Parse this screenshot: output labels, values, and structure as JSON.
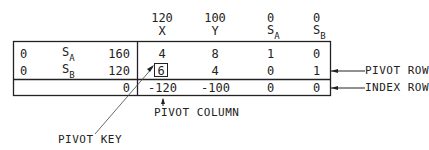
{
  "header": {
    "columns": [
      {
        "coef": "120",
        "var": "X",
        "sub": ""
      },
      {
        "coef": "100",
        "var": "Y",
        "sub": ""
      },
      {
        "coef": "0",
        "var": "S",
        "sub": "A"
      },
      {
        "coef": "0",
        "var": "S",
        "sub": "B"
      }
    ]
  },
  "rows": [
    {
      "cb": "0",
      "basis": "S",
      "basis_sub": "A",
      "rhs": "160",
      "values": [
        "4",
        "8",
        "1",
        "0"
      ]
    },
    {
      "cb": "0",
      "basis": "S",
      "basis_sub": "B",
      "rhs": "120",
      "values": [
        "6",
        "4",
        "0",
        "1"
      ]
    }
  ],
  "index_row": {
    "rhs": "0",
    "values": [
      "-120",
      "-100",
      "0",
      "0"
    ]
  },
  "annotations": {
    "pivot_row": "PIVOT ROW",
    "index_row": "INDEX ROW",
    "pivot_column": "PIVOT COLUMN",
    "pivot_key": "PIVOT KEY"
  }
}
